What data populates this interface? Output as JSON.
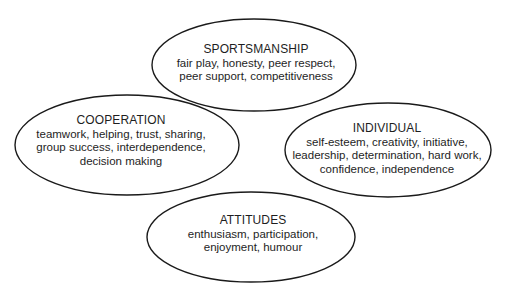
{
  "diagram": {
    "stroke_color": "#1a1a1a",
    "nodes": [
      {
        "id": "sportsmanship",
        "title": "SPORTSMANSHIP",
        "lines": [
          "fair play, honesty, peer respect,",
          "peer support, competitiveness"
        ],
        "cx": 254,
        "cy": 65,
        "rx": 102,
        "ry": 46
      },
      {
        "id": "cooperation",
        "title": "COOPERATION",
        "lines": [
          "teamwork, helping, trust, sharing,",
          "group success, interdependence,",
          "decision making"
        ],
        "cx": 127,
        "cy": 145,
        "rx": 112,
        "ry": 50
      },
      {
        "id": "individual",
        "title": "INDIVIDUAL",
        "lines": [
          "self-esteem, creativity, initiative,",
          "leadership, determination, hard work,",
          "confidence, independence"
        ],
        "cx": 388,
        "cy": 150,
        "rx": 103,
        "ry": 47
      },
      {
        "id": "attitudes",
        "title": "ATTITUDES",
        "lines": [
          "enthusiasm, participation,",
          "enjoyment, humour"
        ],
        "cx": 251,
        "cy": 237,
        "rx": 104,
        "ry": 45
      }
    ]
  }
}
